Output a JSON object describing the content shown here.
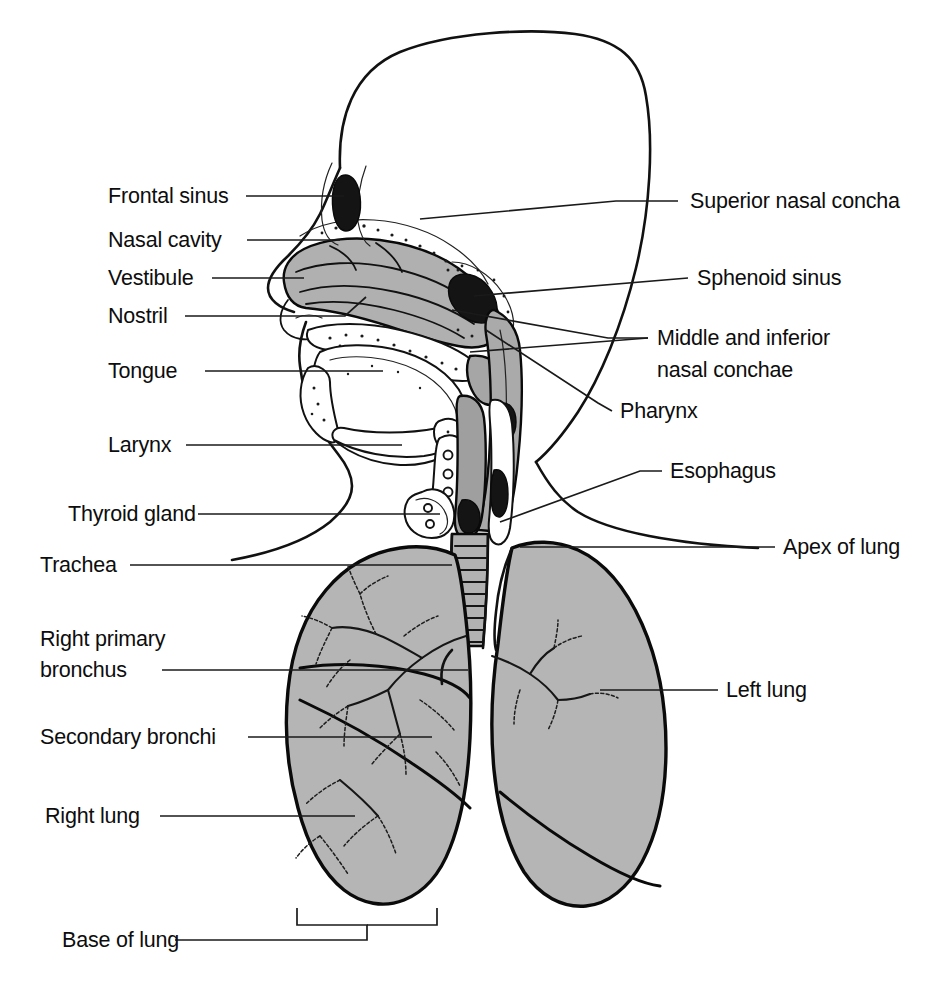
{
  "figure": {
    "width": 952,
    "height": 981,
    "background_color": "#ffffff"
  },
  "style": {
    "organ_gray": "#b5b5b5",
    "mucosa_gray": "#ababab",
    "outline_black": "#111111",
    "leader_black": "#1a1a1a",
    "label_font_size_px": 21.5
  },
  "labels": {
    "left": [
      {
        "id": "frontal-sinus",
        "text": "Frontal sinus",
        "x": 108,
        "y": 203,
        "anchor": "start"
      },
      {
        "id": "nasal-cavity",
        "text": "Nasal cavity",
        "x": 108,
        "y": 247,
        "anchor": "start"
      },
      {
        "id": "vestibule",
        "text": "Vestibule",
        "x": 108,
        "y": 285,
        "anchor": "start"
      },
      {
        "id": "nostril",
        "text": "Nostril",
        "x": 108,
        "y": 323,
        "anchor": "start"
      },
      {
        "id": "tongue",
        "text": "Tongue",
        "x": 108,
        "y": 378,
        "anchor": "start"
      },
      {
        "id": "larynx",
        "text": "Larynx",
        "x": 108,
        "y": 452,
        "anchor": "start"
      },
      {
        "id": "thyroid-gland",
        "text": "Thyroid gland",
        "x": 68,
        "y": 521,
        "anchor": "start"
      },
      {
        "id": "trachea",
        "text": "Trachea",
        "x": 40,
        "y": 572,
        "anchor": "start"
      },
      {
        "id": "right-primary-bronchus-line1",
        "text": "Right primary",
        "x": 40,
        "y": 646,
        "anchor": "start"
      },
      {
        "id": "right-primary-bronchus-line2",
        "text": "bronchus",
        "x": 40,
        "y": 677,
        "anchor": "start"
      },
      {
        "id": "secondary-bronchi",
        "text": "Secondary bronchi",
        "x": 40,
        "y": 744,
        "anchor": "start"
      },
      {
        "id": "right-lung",
        "text": "Right lung",
        "x": 45,
        "y": 823,
        "anchor": "start"
      },
      {
        "id": "base-of-lung",
        "text": "Base of lung",
        "x": 62,
        "y": 947,
        "anchor": "start"
      }
    ],
    "right": [
      {
        "id": "superior-nasal-concha",
        "text": "Superior nasal concha",
        "x": 690,
        "y": 208,
        "anchor": "start"
      },
      {
        "id": "sphenoid-sinus",
        "text": "Sphenoid sinus",
        "x": 697,
        "y": 285,
        "anchor": "start"
      },
      {
        "id": "middle-inferior-nasal-conchae-line1",
        "text": "Middle and inferior",
        "x": 657,
        "y": 345,
        "anchor": "start"
      },
      {
        "id": "middle-inferior-nasal-conchae-line2",
        "text": "nasal conchae",
        "x": 657,
        "y": 377,
        "anchor": "start"
      },
      {
        "id": "pharynx",
        "text": "Pharynx",
        "x": 620,
        "y": 418,
        "anchor": "start"
      },
      {
        "id": "esophagus",
        "text": "Esophagus",
        "x": 670,
        "y": 478,
        "anchor": "start"
      },
      {
        "id": "apex-of-lung",
        "text": "Apex of lung",
        "x": 783,
        "y": 554,
        "anchor": "start"
      },
      {
        "id": "left-lung",
        "text": "Left lung",
        "x": 726,
        "y": 697,
        "anchor": "start"
      }
    ]
  },
  "leaders": {
    "frontal_sinus": "M 246 196 L 344 196",
    "nasal_cavity": "M 247 240 L 340 240",
    "vestibule": "M 212 278 L 304 278",
    "nostril": "M 185 316 L 345 316 L 366 297",
    "tongue": "M 205 371 L 383 371",
    "larynx": "M 186 445 L 402 445",
    "thyroid_gland": "M 198 514 L 440 514",
    "trachea": "M 130 565 L 452 565",
    "right_primary_bronchus": "M 162 670 L 468 670",
    "secondary_bronchi": "M 248 737 L 432 737",
    "right_lung": "M 160 816 L 355 816",
    "base_of_lung": "M 175 940 L 367 940 L 367 925 L 297 925 M 297 925 L 297 908 M 437 925 L 437 908 M 367 925 L 437 925",
    "superior_nasal_concha": "M 678 201 L 616 201 L 420 218",
    "sphenoid_sinus": "M 688 278 L 474 278",
    "middle_inferior_nasal_conchae": "M 648 338 L 608 338 L 455 313",
    "middle_inferior_nasal_conchae_2": "M 648 338 L 470 349",
    "pharynx": "M 612 411 L 596 404 L 470 322",
    "esophagus": "M 662 471 L 640 471 L 492 520",
    "apex_of_lung": "M 775 547 L 496 547",
    "left_lung": "M 718 690 L 600 690"
  },
  "structures": [
    {
      "id": "head-outline",
      "name": "head-profile-outline"
    },
    {
      "id": "nasal-cavity",
      "name": "nasal-cavity-mucosa"
    },
    {
      "id": "frontal-sinus",
      "name": "frontal-sinus-cavity"
    },
    {
      "id": "sphenoid-sinus",
      "name": "sphenoid-sinus-cavity"
    },
    {
      "id": "tongue",
      "name": "tongue-body"
    },
    {
      "id": "pharynx",
      "name": "pharynx-passage"
    },
    {
      "id": "larynx",
      "name": "larynx-cartilage"
    },
    {
      "id": "thyroid-gland",
      "name": "thyroid-gland-body"
    },
    {
      "id": "trachea",
      "name": "trachea-tube"
    },
    {
      "id": "esophagus",
      "name": "esophagus-tube"
    },
    {
      "id": "right-lung",
      "name": "right-lung-body"
    },
    {
      "id": "left-lung",
      "name": "left-lung-body"
    },
    {
      "id": "bronchial-tree",
      "name": "bronchial-tree"
    }
  ]
}
